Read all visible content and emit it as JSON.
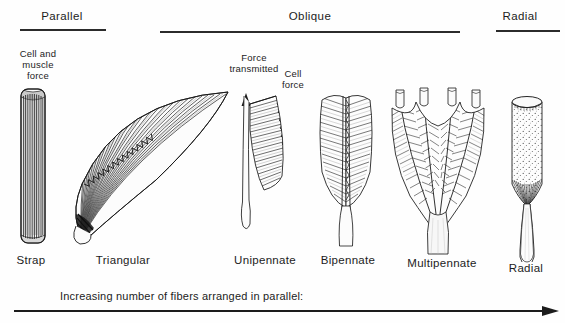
{
  "figure": {
    "title_groups": [
      {
        "id": "parallel",
        "label": "Parallel"
      },
      {
        "id": "oblique",
        "label": "Oblique"
      },
      {
        "id": "radial",
        "label": "Radial"
      }
    ],
    "annotations": {
      "cell_and_muscle_force": "Cell and\nmuscle\nforce",
      "cell_and_muscle_force_lines": [
        "Cell and",
        "muscle",
        "force"
      ],
      "force_transmitted_lines": [
        "Force",
        "transmitted"
      ],
      "cell_force_lines": [
        "Cell",
        "force"
      ]
    },
    "specimens": [
      {
        "id": "strap",
        "label": "Strap",
        "group": "parallel"
      },
      {
        "id": "triangular",
        "label": "Triangular",
        "group": "parallel"
      },
      {
        "id": "unipennate",
        "label": "Unipennate",
        "group": "oblique"
      },
      {
        "id": "bipennate",
        "label": "Bipennate",
        "group": "oblique"
      },
      {
        "id": "multipennate",
        "label": "Multipennate",
        "group": "oblique"
      },
      {
        "id": "radial",
        "label": "Radial",
        "group": "radial"
      }
    ],
    "caption": "Increasing number of fibers arranged in parallel:",
    "colors": {
      "ink": "#1c1c1c",
      "rule": "#2b2b2b",
      "background": "#fefefe",
      "fiber": "#222222",
      "stipple": "#333333"
    }
  }
}
